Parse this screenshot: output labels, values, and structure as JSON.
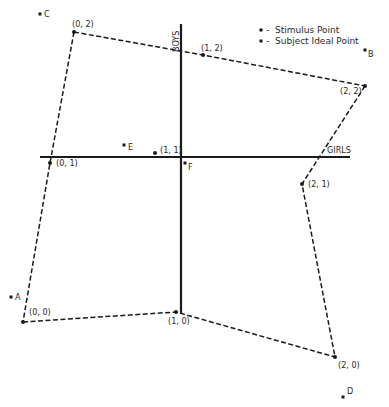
{
  "axes": {
    "vertical": {
      "label": "BOYS",
      "x": 181,
      "y1": 24,
      "y2": 313
    },
    "horizontal": {
      "label": "GIRLS",
      "y": 157,
      "x1": 40,
      "x2": 350
    }
  },
  "legend": {
    "stimulus": "Stimulus Point",
    "subject": "Subject Ideal Point",
    "dash": "-"
  },
  "stimulus_points": [
    {
      "label": "(0, 2)",
      "x": 74,
      "y": 32
    },
    {
      "label": "(1, 2)",
      "x": 203,
      "y": 55
    },
    {
      "label": "(2, 2)",
      "x": 365,
      "y": 86
    },
    {
      "label": "(0, 1)",
      "x": 50,
      "y": 163
    },
    {
      "label": "(1, 1)",
      "x": 155,
      "y": 153
    },
    {
      "label": "(2, 1)",
      "x": 302,
      "y": 184
    },
    {
      "label": "(0, 0)",
      "x": 23,
      "y": 322
    },
    {
      "label": "(1, 0)",
      "x": 176,
      "y": 312
    },
    {
      "label": "(2, 0)",
      "x": 335,
      "y": 357
    }
  ],
  "subject_points": [
    {
      "label": "A",
      "x": 11,
      "y": 297
    },
    {
      "label": "B",
      "x": 365,
      "y": 50
    },
    {
      "label": "C",
      "x": 40,
      "y": 14
    },
    {
      "label": "D",
      "x": 343,
      "y": 397
    },
    {
      "label": "E",
      "x": 124,
      "y": 145
    },
    {
      "label": "F",
      "x": 185,
      "y": 163
    }
  ]
}
